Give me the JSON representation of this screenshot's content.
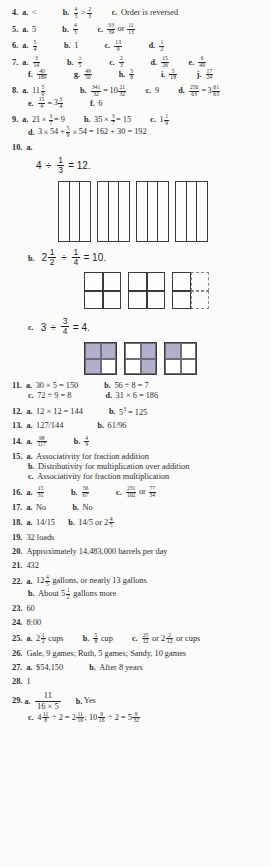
{
  "page": {
    "type": "answer-key",
    "background_color": "#fbfbfa",
    "text_color": "#2b2b2b",
    "shade_color": "#b0b0cc"
  },
  "items": [
    {
      "number": "4.",
      "parts": [
        {
          "label": "a.",
          "text": "<"
        },
        {
          "label": "b.",
          "text": "4/3 > 2/3"
        },
        {
          "label": "c.",
          "text": "Order is reversed"
        }
      ]
    },
    {
      "number": "5.",
      "parts": [
        {
          "label": "a.",
          "text": "5"
        },
        {
          "label": "b.",
          "text": "4/3"
        },
        {
          "label": "c.",
          "text": "33/39 or 11/13"
        }
      ]
    },
    {
      "number": "6.",
      "parts": [
        {
          "label": "a.",
          "text": "5/4"
        },
        {
          "label": "b.",
          "text": "1"
        },
        {
          "label": "c.",
          "text": "13/9"
        },
        {
          "label": "d.",
          "text": "1/2"
        }
      ]
    },
    {
      "number": "7.",
      "parts": [
        {
          "label": "a.",
          "text": "3/14"
        },
        {
          "label": "b.",
          "text": "1/5"
        },
        {
          "label": "c.",
          "text": "2/3"
        },
        {
          "label": "d.",
          "text": "15/26"
        },
        {
          "label": "e.",
          "text": "6/49"
        },
        {
          "label": "f.",
          "text": "40/189"
        },
        {
          "label": "g.",
          "text": "49/50"
        },
        {
          "label": "h.",
          "text": "5/8"
        },
        {
          "label": "i.",
          "text": "5/18"
        },
        {
          "label": "j.",
          "text": "17/24"
        }
      ]
    },
    {
      "number": "8.",
      "parts": [
        {
          "label": "a.",
          "text": "11 5/9"
        },
        {
          "label": "b.",
          "text": "341/32 = 10 21/32"
        },
        {
          "label": "c.",
          "text": "9"
        },
        {
          "label": "d.",
          "text": "250/63 = 3 61/63"
        },
        {
          "label": "e.",
          "text": "15/4 = 3 3/4"
        },
        {
          "label": "f.",
          "text": "6"
        }
      ]
    },
    {
      "number": "9.",
      "parts": [
        {
          "label": "a.",
          "text": "21 × 3/7 = 9"
        },
        {
          "label": "b.",
          "text": "35 × 3/7 = 15"
        },
        {
          "label": "c.",
          "text": "1 1/9"
        },
        {
          "label": "d.",
          "text": "3 × 54 + 5/9 × 54 = 162 + 30 = 192"
        }
      ]
    },
    {
      "number": "10.",
      "parts": [
        {
          "label": "a.",
          "equation_whole": "4",
          "equation_op": "÷",
          "equation_frac_n": "1",
          "equation_frac_d": "3",
          "equation_result": "= 12."
        },
        {
          "label": "b.",
          "equation_whole": "2 1/2",
          "equation_op": "÷",
          "equation_frac_n": "1",
          "equation_frac_d": "4",
          "equation_result": "= 10."
        },
        {
          "label": "c.",
          "equation_whole": "3",
          "equation_op": "÷",
          "equation_frac_n": "3",
          "equation_frac_d": "4",
          "equation_result": "= 4."
        }
      ]
    },
    {
      "number": "11.",
      "parts": [
        {
          "label": "a.",
          "text": "30 × 5 = 150"
        },
        {
          "label": "b.",
          "text": "56 ÷ 8 = 7"
        },
        {
          "label": "c.",
          "text": "72 ÷ 9 = 8"
        },
        {
          "label": "d.",
          "text": "31 × 6 = 186"
        }
      ]
    },
    {
      "number": "12.",
      "parts": [
        {
          "label": "a.",
          "text": "12 × 12 = 144"
        },
        {
          "label": "b.",
          "text": "5³ = 125"
        }
      ]
    },
    {
      "number": "13.",
      "parts": [
        {
          "label": "a.",
          "text": "127/144"
        },
        {
          "label": "b.",
          "text": "61/96"
        }
      ]
    },
    {
      "number": "14.",
      "parts": [
        {
          "label": "a.",
          "text": "98/117"
        },
        {
          "label": "b.",
          "text": "4/9"
        }
      ]
    },
    {
      "number": "15.",
      "parts": [
        {
          "label": "a.",
          "text": "Associativity for fraction addition"
        },
        {
          "label": "b.",
          "text": "Distributivity for multiplication over addition"
        },
        {
          "label": "c.",
          "text": "Associativity for fraction multiplication"
        }
      ]
    },
    {
      "number": "16.",
      "parts": [
        {
          "label": "a.",
          "text": "15/31"
        },
        {
          "label": "b.",
          "text": "56/67"
        },
        {
          "label": "c.",
          "text": "231/102 or 77/34"
        }
      ]
    },
    {
      "number": "17.",
      "parts": [
        {
          "label": "a.",
          "text": "No"
        },
        {
          "label": "b.",
          "text": "No"
        }
      ]
    },
    {
      "number": "18.",
      "parts": [
        {
          "label": "a.",
          "text": "14/15"
        },
        {
          "label": "b.",
          "text": "14/5 or 2 4/5"
        }
      ]
    },
    {
      "number": "19.",
      "parts": [
        {
          "label": "",
          "text": "32 loads"
        }
      ]
    },
    {
      "number": "20.",
      "parts": [
        {
          "label": "",
          "text": "Approximately 14,483,000 barrels per day"
        }
      ]
    },
    {
      "number": "21.",
      "parts": [
        {
          "label": "",
          "text": "432"
        }
      ]
    },
    {
      "number": "22.",
      "parts": [
        {
          "label": "a.",
          "text": "12 4/5 gallons, or nearly 13 gallons"
        },
        {
          "label": "b.",
          "text": "About 5 1/2 gallons more"
        }
      ]
    },
    {
      "number": "23.",
      "parts": [
        {
          "label": "",
          "text": "60"
        }
      ]
    },
    {
      "number": "24.",
      "parts": [
        {
          "label": "",
          "text": "8:00"
        }
      ]
    },
    {
      "number": "25.",
      "parts": [
        {
          "label": "a.",
          "text": "2 1/2 cups"
        },
        {
          "label": "b.",
          "text": "5/8 cup"
        },
        {
          "label": "c.",
          "text": "25/12 or 2 2/12 or cups"
        }
      ]
    },
    {
      "number": "26.",
      "parts": [
        {
          "label": "",
          "text": "Gale, 9 games; Ruth, 5 games; Sandy, 10 games"
        }
      ]
    },
    {
      "number": "27.",
      "parts": [
        {
          "label": "a.",
          "text": "$54,150"
        },
        {
          "label": "b.",
          "text": "After 8 years"
        }
      ]
    },
    {
      "number": "28.",
      "parts": [
        {
          "label": "",
          "text": "1"
        }
      ]
    },
    {
      "number": "29.",
      "parts": [
        {
          "label": "a.",
          "text": "11 / (16 × 5)"
        },
        {
          "label": "b.",
          "text": "Yes"
        },
        {
          "label": "c.",
          "text": "4 11/8 ÷ 2 = 2 11/16; 10 9/16 ÷ 2 = 5 9/32"
        }
      ]
    }
  ],
  "labels": {
    "n4": "4.",
    "n5": "5.",
    "n6": "6.",
    "n7": "7.",
    "n8": "8.",
    "n9": "9.",
    "n10": "10.",
    "n11": "11.",
    "n12": "12.",
    "n13": "13.",
    "n14": "14.",
    "n15": "15.",
    "n16": "16.",
    "n17": "17.",
    "n18": "18.",
    "n19": "19.",
    "n20": "20.",
    "n21": "21.",
    "n22": "22.",
    "n23": "23.",
    "n24": "24.",
    "n25": "25.",
    "n26": "26.",
    "n27": "27.",
    "n28": "28.",
    "n29": "29.",
    "a": "a.",
    "b": "b.",
    "c": "c.",
    "d": "d.",
    "e": "e.",
    "f": "f.",
    "g": "g.",
    "h": "h.",
    "i": "i.",
    "j": "j."
  },
  "text": {
    "lt": "<",
    "gt": ">",
    "times": "×",
    "div": "÷",
    "eq": "=",
    "order_reversed": "Order is reversed",
    "five": "5",
    "one": "1",
    "nine": "9",
    "six": "6",
    "or": "or",
    "assoc_add": "Associativity for fraction addition",
    "distrib": "Distributivity for multiplication over addition",
    "assoc_mult": "Associativity for fraction multiplication",
    "no": "No",
    "yes": "Yes",
    "loads32": "32 loads",
    "barrels": "Approximately 14,483,000 barrels per day",
    "n432": "432",
    "gallons_a": "gallons, or nearly 13 gallons",
    "gallons_b_pre": "About",
    "gallons_b_post": "gallons more",
    "n60": "60",
    "time800": "8:00",
    "cups": "cups",
    "cup": "cup",
    "or_cups": "or cups",
    "games": "Gale, 9 games; Ruth, 5 games; Sandy, 10 games",
    "money": "$54,150",
    "after8": "After 8 years",
    "one28": "1",
    "eq150": "30 × 5 = 150",
    "eq56": "56 ÷ 8 = 7",
    "eq72": "72 ÷ 9 = 8",
    "eq31": "31 × 6 = 186",
    "eq144": "12 × 12 = 144",
    "eq125": "5",
    "eq125sup": "3",
    "eq125b": "= 125",
    "f127": "127/144",
    "f61": "61/96",
    "eq21": "21",
    "eq21b": "= 9",
    "eq35": "35",
    "eq35b": "= 15",
    "eq9d_a": "3",
    "eq9d_b": "54 +",
    "eq9d_c": "54 = 162 + 30 = 192",
    "p14_15": "14/15",
    "p14_5": "14/5 or",
    "item10a_w": "4",
    "item10a_r": "= 12.",
    "item10b_r": "= 10.",
    "item10c_w": "3",
    "item10c_r": "= 4.",
    "item29a_n": "11",
    "item29a_d": "16 × 5",
    "item29c_1": "4",
    "item29c_2": "÷ 2 =",
    "item29c_3": "2",
    "item29c_4": "; 10",
    "item29c_5": "÷ 2 = 5"
  }
}
